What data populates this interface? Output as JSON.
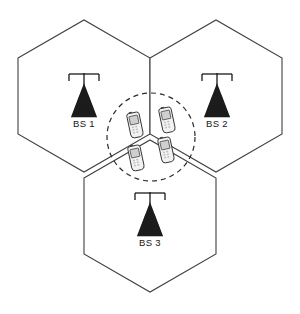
{
  "diagram": {
    "type": "cellular-coverage-diagram",
    "background_color": "#ffffff",
    "line_color": "#404040",
    "canvas": {
      "width": 300,
      "height": 314
    }
  },
  "cells": [
    {
      "id": "cell-1",
      "name": "upper-left-cell",
      "points": "18,58 84,20 150,58 150,134 84,172 18,134"
    },
    {
      "id": "cell-2",
      "name": "upper-right-cell",
      "points": "150,58 216,20 282,58 282,134 216,172 150,134"
    },
    {
      "id": "cell-3",
      "name": "bottom-cell",
      "points": "84,178 150,140 216,178 216,254 150,292 84,254"
    }
  ],
  "coverage_zone": {
    "label": "overlap-coverage-area",
    "center_x": 151,
    "center_y": 137,
    "radius": 44,
    "style": "dashed",
    "color": "#2b2b2b"
  },
  "base_stations": [
    {
      "id": "bs-1",
      "label": "BS 1",
      "x": 84,
      "y": 74,
      "label_x": 84,
      "label_y": 127
    },
    {
      "id": "bs-2",
      "label": "BS 2",
      "x": 217,
      "y": 74,
      "label_x": 217,
      "label_y": 127
    },
    {
      "id": "bs-3",
      "label": "BS 3",
      "x": 150,
      "y": 193,
      "label_x": 150,
      "label_y": 246
    }
  ],
  "mobile_devices": [
    {
      "id": "ms-1",
      "label": "mobile-station-1",
      "x": 135,
      "y": 125,
      "rotation": -12
    },
    {
      "id": "ms-2",
      "label": "mobile-station-2",
      "x": 167,
      "y": 120,
      "rotation": -12
    },
    {
      "id": "ms-3",
      "label": "mobile-station-3",
      "x": 166,
      "y": 150,
      "rotation": -12
    },
    {
      "id": "ms-4",
      "label": "mobile-station-4",
      "x": 136,
      "y": 158,
      "rotation": -12
    }
  ],
  "legend": {
    "base_station_count": 3,
    "mobile_device_count": 4
  }
}
